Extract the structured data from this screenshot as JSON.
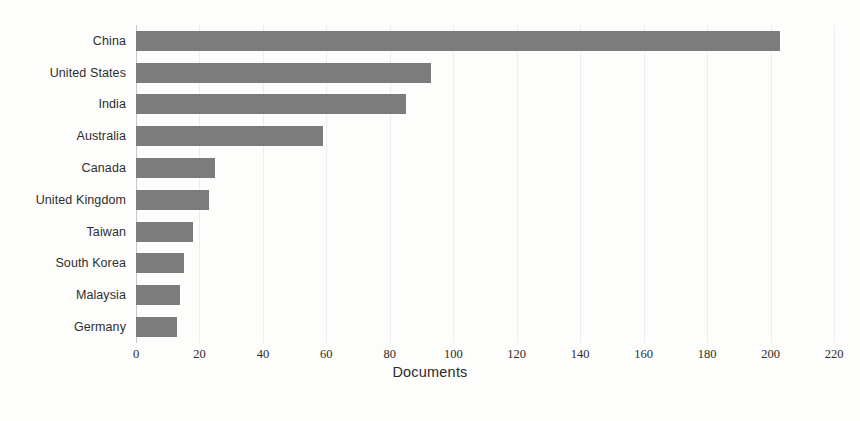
{
  "chart_data": {
    "type": "bar",
    "orientation": "horizontal",
    "title": "",
    "xlabel": "Documents",
    "ylabel": "",
    "categories": [
      "China",
      "United States",
      "India",
      "Australia",
      "Canada",
      "United Kingdom",
      "Taiwan",
      "South Korea",
      "Malaysia",
      "Germany"
    ],
    "values": [
      203,
      93,
      85,
      59,
      25,
      23,
      18,
      15,
      14,
      13
    ],
    "xlim": [
      0,
      220
    ],
    "ylim": null,
    "xticks": [
      0,
      20,
      40,
      60,
      80,
      100,
      120,
      140,
      160,
      180,
      200,
      220
    ],
    "xtick_labels": [
      "0",
      "20",
      "40",
      "60",
      "80",
      "100",
      "120",
      "140",
      "160",
      "180",
      "200",
      "220"
    ],
    "grid": true,
    "grid_axis": "x",
    "legend": null,
    "bar_color": "#7c7c7c",
    "background_color": "#fdfdfc"
  },
  "axis": {
    "x_title": "Documents"
  },
  "caption": {
    "text": ""
  }
}
